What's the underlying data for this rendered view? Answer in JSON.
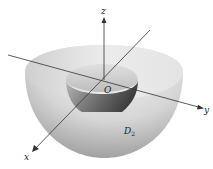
{
  "figure": {
    "axes": {
      "x_label": "x",
      "y_label": "y",
      "z_label": "z",
      "origin_label": "O"
    },
    "region_label": "D",
    "region_subscript": "2",
    "colors": {
      "outer_surface": "#cfcfcf",
      "inner_surface": "#8a8a8a",
      "axis": "#333333",
      "background": "#ffffff"
    }
  }
}
